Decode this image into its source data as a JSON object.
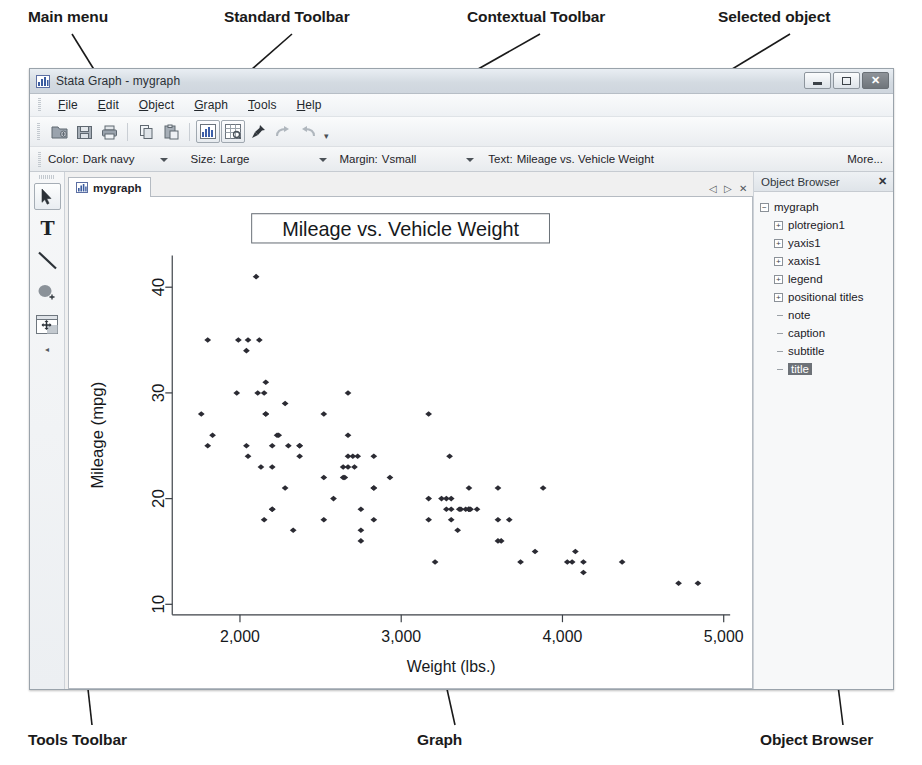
{
  "annotations": {
    "top": [
      {
        "id": "main-menu",
        "label": "Main menu"
      },
      {
        "id": "standard-toolbar",
        "label": "Standard Toolbar"
      },
      {
        "id": "contextual-toolbar",
        "label": "Contextual Toolbar"
      },
      {
        "id": "selected-object",
        "label": "Selected object"
      }
    ],
    "bottom": [
      {
        "id": "tools-toolbar",
        "label": "Tools Toolbar"
      },
      {
        "id": "graph",
        "label": "Graph"
      },
      {
        "id": "object-browser",
        "label": "Object Browser"
      }
    ]
  },
  "window": {
    "title": "Stata Graph - mygraph",
    "icon": "graph-icon",
    "controls": {
      "minimize": "minimize-button",
      "maximize": "maximize-button",
      "close": "close-button",
      "close_glyph": "✕"
    }
  },
  "menubar": {
    "items": [
      {
        "pre": "",
        "accel": "F",
        "post": "ile"
      },
      {
        "pre": "",
        "accel": "E",
        "post": "dit"
      },
      {
        "pre": "",
        "accel": "O",
        "post": "bject"
      },
      {
        "pre": "",
        "accel": "G",
        "post": "raph"
      },
      {
        "pre": "",
        "accel": "T",
        "post": "ools"
      },
      {
        "pre": "",
        "accel": "H",
        "post": "elp"
      }
    ]
  },
  "standard_toolbar": {
    "buttons": [
      {
        "name": "open-icon",
        "framed": false
      },
      {
        "name": "save-icon",
        "framed": false
      },
      {
        "name": "print-icon",
        "framed": false
      },
      {
        "name": "copy-icon",
        "framed": false
      },
      {
        "name": "paste-icon",
        "framed": false
      },
      {
        "name": "graph-editor-icon",
        "framed": true
      },
      {
        "name": "grid-editor-icon",
        "framed": true
      },
      {
        "name": "pin-icon",
        "framed": false
      },
      {
        "name": "redo-icon",
        "framed": false
      },
      {
        "name": "undo-icon",
        "framed": false
      }
    ],
    "overflow_glyph": "▾"
  },
  "contextual_toolbar": {
    "groups": [
      {
        "label": "Color:",
        "value": "Dark navy",
        "has_arrow": true
      },
      {
        "label": "Size:",
        "value": "Large",
        "has_arrow": true
      },
      {
        "label": "Margin:",
        "value": "Vsmall",
        "has_arrow": true
      },
      {
        "label": "Text:",
        "value": "Mileage vs. Vehicle Weight",
        "has_arrow": false
      }
    ],
    "more_label": "More..."
  },
  "tools_toolbar": {
    "tools": [
      {
        "name": "pointer-tool",
        "selected": true
      },
      {
        "name": "text-tool",
        "selected": false
      },
      {
        "name": "line-tool",
        "selected": false
      },
      {
        "name": "shape-tool",
        "selected": false
      },
      {
        "name": "grid-move-tool",
        "selected": false
      }
    ],
    "collapse_glyph": "◂"
  },
  "document": {
    "tab_label": "mygraph",
    "tab_icon": "graph-icon",
    "nav": {
      "prev": "◁",
      "next": "▷",
      "close": "✕"
    }
  },
  "object_browser": {
    "header": "Object Browser",
    "close_glyph": "✕",
    "tree": [
      {
        "label": "mygraph",
        "depth": 0,
        "marker": "minus",
        "selected": false
      },
      {
        "label": "plotregion1",
        "depth": 1,
        "marker": "plus",
        "selected": false
      },
      {
        "label": "yaxis1",
        "depth": 1,
        "marker": "plus",
        "selected": false
      },
      {
        "label": "xaxis1",
        "depth": 1,
        "marker": "plus",
        "selected": false
      },
      {
        "label": "legend",
        "depth": 1,
        "marker": "plus",
        "selected": false
      },
      {
        "label": "positional titles",
        "depth": 1,
        "marker": "plus",
        "selected": false
      },
      {
        "label": "note",
        "depth": 1,
        "marker": "leaf",
        "selected": false
      },
      {
        "label": "caption",
        "depth": 1,
        "marker": "leaf",
        "selected": false
      },
      {
        "label": "subtitle",
        "depth": 1,
        "marker": "leaf",
        "selected": false
      },
      {
        "label": "title",
        "depth": 1,
        "marker": "leaf",
        "selected": true
      }
    ]
  },
  "chart_data": {
    "type": "scatter",
    "title": "Mileage vs. Vehicle Weight",
    "title_selected": true,
    "xlabel": "Weight (lbs.)",
    "ylabel": "Mileage (mpg)",
    "xticks": [
      2000,
      3000,
      4000,
      5000
    ],
    "xticklabels": [
      "2,000",
      "3,000",
      "4,000",
      "5,000"
    ],
    "yticks": [
      10,
      20,
      30,
      40
    ],
    "yticklabels": [
      "10",
      "20",
      "30",
      "40"
    ],
    "xlim": [
      1580,
      5040
    ],
    "ylim": [
      9,
      43
    ],
    "grid": false,
    "legend": null,
    "marker_color": "#2b2b33",
    "points": [
      [
        2930,
        22
      ],
      [
        3350,
        17
      ],
      [
        2640,
        22
      ],
      [
        3250,
        20
      ],
      [
        4080,
        15
      ],
      [
        3670,
        18
      ],
      [
        2230,
        26
      ],
      [
        3280,
        20
      ],
      [
        2750,
        16
      ],
      [
        3430,
        19
      ],
      [
        3210,
        14
      ],
      [
        4060,
        14
      ],
      [
        3600,
        21
      ],
      [
        3600,
        18
      ],
      [
        3740,
        14
      ],
      [
        4840,
        12
      ],
      [
        4720,
        12
      ],
      [
        3830,
        15
      ],
      [
        2580,
        20
      ],
      [
        4130,
        13
      ],
      [
        4370,
        14
      ],
      [
        4030,
        14
      ],
      [
        3620,
        16
      ],
      [
        4130,
        14
      ],
      [
        2830,
        21
      ],
      [
        2200,
        19
      ],
      [
        2520,
        22
      ],
      [
        2330,
        17
      ],
      [
        2200,
        23
      ],
      [
        2150,
        18
      ],
      [
        2670,
        24
      ],
      [
        2370,
        25
      ],
      [
        2160,
        28
      ],
      [
        2670,
        30
      ],
      [
        1800,
        35
      ],
      [
        1760,
        28
      ],
      [
        2050,
        24
      ],
      [
        2200,
        19
      ],
      [
        2150,
        30
      ],
      [
        2670,
        26
      ],
      [
        3310,
        18
      ],
      [
        2830,
        18
      ],
      [
        3370,
        19
      ],
      [
        2830,
        21
      ],
      [
        2120,
        35
      ],
      [
        2160,
        28
      ],
      [
        2700,
        24
      ],
      [
        2240,
        26
      ],
      [
        1830,
        26
      ],
      [
        2520,
        18
      ],
      [
        2100,
        41
      ],
      [
        2040,
        25
      ],
      [
        2300,
        25
      ],
      [
        2750,
        17
      ],
      [
        2130,
        23
      ],
      [
        1990,
        35
      ],
      [
        3170,
        20
      ],
      [
        2710,
        23
      ],
      [
        2370,
        24
      ],
      [
        2280,
        21
      ],
      [
        2750,
        19
      ],
      [
        3170,
        18
      ],
      [
        2640,
        23
      ],
      [
        2830,
        24
      ],
      [
        2370,
        25
      ],
      [
        2200,
        25
      ],
      [
        2520,
        28
      ],
      [
        1980,
        30
      ],
      [
        1800,
        25
      ],
      [
        3170,
        28
      ],
      [
        2670,
        23
      ],
      [
        3420,
        21
      ],
      [
        3880,
        21
      ],
      [
        3420,
        19
      ],
      [
        3420,
        19
      ],
      [
        3470,
        19
      ],
      [
        3280,
        19
      ],
      [
        3310,
        20
      ],
      [
        3600,
        16
      ],
      [
        2160,
        31
      ],
      [
        2040,
        34
      ],
      [
        3300,
        24
      ],
      [
        3360,
        19
      ],
      [
        3420,
        19
      ],
      [
        2650,
        22
      ],
      [
        2730,
        24
      ],
      [
        3400,
        19
      ],
      [
        3310,
        19
      ],
      [
        2050,
        35
      ],
      [
        2280,
        29
      ],
      [
        2110,
        30
      ]
    ]
  }
}
